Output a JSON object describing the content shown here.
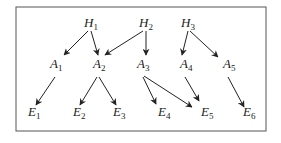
{
  "diagram": {
    "type": "directed-graph",
    "frame": {
      "x": 16,
      "y": 7,
      "width": 250,
      "height": 124,
      "stroke": "#555555"
    },
    "nodes": [
      {
        "id": "H1",
        "letter": "H",
        "sub": "1",
        "x": 89,
        "y": 27
      },
      {
        "id": "H2",
        "letter": "H",
        "sub": "2",
        "x": 144,
        "y": 27
      },
      {
        "id": "H3",
        "letter": "H",
        "sub": "3",
        "x": 186,
        "y": 27
      },
      {
        "id": "A1",
        "letter": "A",
        "sub": "1",
        "x": 55,
        "y": 68
      },
      {
        "id": "A2",
        "letter": "A",
        "sub": "2",
        "x": 98,
        "y": 68
      },
      {
        "id": "A3",
        "letter": "A",
        "sub": "3",
        "x": 142,
        "y": 68
      },
      {
        "id": "A4",
        "letter": "A",
        "sub": "4",
        "x": 185,
        "y": 68
      },
      {
        "id": "A5",
        "letter": "A",
        "sub": "5",
        "x": 228,
        "y": 68
      },
      {
        "id": "E1",
        "letter": "E",
        "sub": "1",
        "x": 33,
        "y": 116
      },
      {
        "id": "E2",
        "letter": "E",
        "sub": "2",
        "x": 78,
        "y": 116
      },
      {
        "id": "E3",
        "letter": "E",
        "sub": "3",
        "x": 118,
        "y": 116
      },
      {
        "id": "E4",
        "letter": "E",
        "sub": "4",
        "x": 163,
        "y": 116
      },
      {
        "id": "E5",
        "letter": "E",
        "sub": "5",
        "x": 206,
        "y": 116
      },
      {
        "id": "E6",
        "letter": "E",
        "sub": "6",
        "x": 248,
        "y": 116
      }
    ],
    "edges": [
      {
        "from": "H1",
        "to": "A1",
        "x1": 88,
        "y1": 31,
        "x2": 64,
        "y2": 55
      },
      {
        "from": "H1",
        "to": "A2",
        "x1": 91,
        "y1": 31,
        "x2": 98,
        "y2": 55
      },
      {
        "from": "H2",
        "to": "A2",
        "x1": 143,
        "y1": 31,
        "x2": 105,
        "y2": 55
      },
      {
        "from": "H2",
        "to": "A3",
        "x1": 146,
        "y1": 31,
        "x2": 146,
        "y2": 55
      },
      {
        "from": "H3",
        "to": "A4",
        "x1": 188,
        "y1": 31,
        "x2": 182,
        "y2": 55
      },
      {
        "from": "H3",
        "to": "A5",
        "x1": 190,
        "y1": 31,
        "x2": 218,
        "y2": 57
      },
      {
        "from": "A1",
        "to": "E1",
        "x1": 55,
        "y1": 77,
        "x2": 36,
        "y2": 105
      },
      {
        "from": "A2",
        "to": "E2",
        "x1": 97,
        "y1": 77,
        "x2": 80,
        "y2": 105
      },
      {
        "from": "A2",
        "to": "E3",
        "x1": 99,
        "y1": 77,
        "x2": 116,
        "y2": 105
      },
      {
        "from": "A3",
        "to": "E4",
        "x1": 143,
        "y1": 77,
        "x2": 156,
        "y2": 104
      },
      {
        "from": "A3",
        "to": "E5",
        "x1": 144,
        "y1": 76,
        "x2": 192,
        "y2": 107
      },
      {
        "from": "A4",
        "to": "E5",
        "x1": 185,
        "y1": 77,
        "x2": 199,
        "y2": 101
      },
      {
        "from": "A5",
        "to": "E6",
        "x1": 228,
        "y1": 77,
        "x2": 244,
        "y2": 107
      }
    ]
  }
}
